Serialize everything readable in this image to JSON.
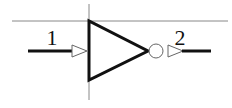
{
  "diagram": {
    "type": "logic-gate-symbol",
    "gate": "inverter",
    "pins": [
      {
        "id": "input",
        "label": "1"
      },
      {
        "id": "output",
        "label": "2"
      }
    ],
    "colors": {
      "stroke": "#111111",
      "guide": "#777777",
      "background": "#ffffff"
    }
  }
}
